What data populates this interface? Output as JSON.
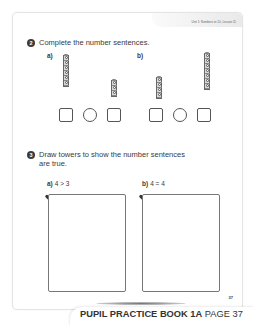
{
  "page": {
    "header": "Unit 1: Numbers to 10, Lesson 11",
    "page_number": "37"
  },
  "question2": {
    "number": "2",
    "instruction": "Complete the number sentences.",
    "parts": [
      {
        "label": "a)",
        "left_tower_cubes": 6,
        "right_tower_cubes": 3
      },
      {
        "label": "b)",
        "left_tower_cubes": 4,
        "right_tower_cubes": 7
      }
    ]
  },
  "question3": {
    "number": "3",
    "instruction_line1": "Draw towers to show the number sentences",
    "instruction_line2": "are true.",
    "parts": [
      {
        "label": "a)",
        "sentence": "4 > 3"
      },
      {
        "label": "b)",
        "sentence": "4 = 4"
      }
    ]
  },
  "footer": {
    "book": "PUPIL PRACTICE BOOK 1A",
    "page": "PAGE 37"
  }
}
